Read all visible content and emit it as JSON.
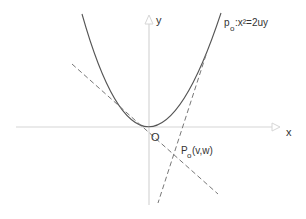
{
  "diagram": {
    "type": "geometry",
    "axes": {
      "x_label": "x",
      "y_label": "y",
      "origin_label": "O"
    },
    "curve": {
      "name_main": "p",
      "name_sub": "o",
      "equation": ":x²=2uy"
    },
    "point": {
      "name_main": "P",
      "name_sub": "o",
      "coords": "(v,w)"
    },
    "colors": {
      "axes": "#d8d8d8",
      "curve": "#555555",
      "tangents": "#777777",
      "text": "#333333"
    }
  }
}
